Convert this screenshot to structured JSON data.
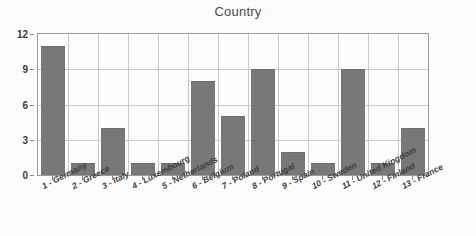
{
  "chart_data": {
    "type": "bar",
    "title": "Country",
    "xlabel": "",
    "ylabel": "",
    "categories": [
      "1 - Germany",
      "2 - Greece",
      "3 - Italy",
      "4 - Luxembourg",
      "5 - Netherlands",
      "6 - Belgium",
      "7 - Poland",
      "8 - Portugal",
      "9 - Spain",
      "10 - Sweden",
      "11 - United Kingdom",
      "12 - Finland",
      "13 - France"
    ],
    "values": [
      11,
      1,
      4,
      1,
      1,
      8,
      5,
      9,
      2,
      1,
      9,
      1,
      4
    ],
    "ylim": [
      0,
      12
    ],
    "yticks": [
      0,
      3,
      6,
      9,
      12
    ],
    "ytick_labels": [
      "0",
      "3",
      "6",
      "9",
      "12"
    ],
    "grid": true,
    "legend": false,
    "bar_color": "#787878",
    "grid_color": "#c9c9c9",
    "axis_color": "#9a9a9a",
    "background_color": "#fdfdfd",
    "title_color": "#4a4a4a"
  }
}
